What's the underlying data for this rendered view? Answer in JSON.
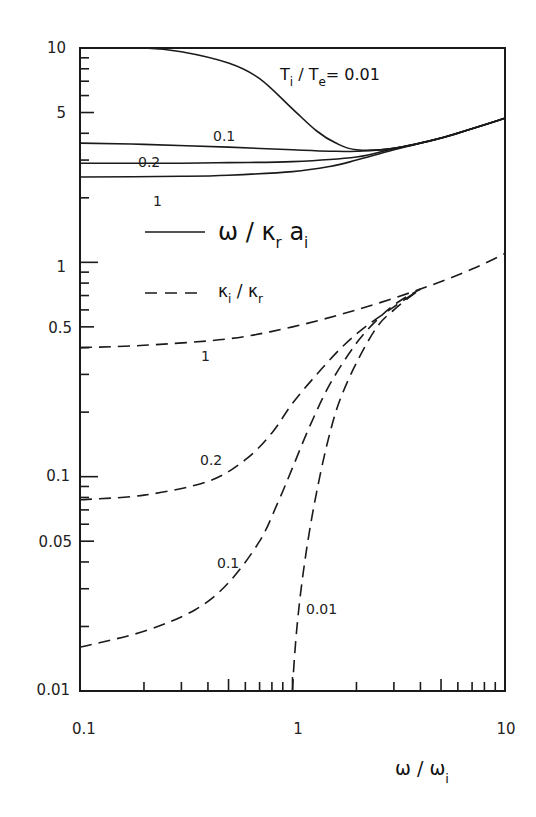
{
  "chart_data": {
    "type": "line",
    "title": "",
    "xlabel": "ω / ω_i",
    "ylabel": "",
    "xscale": "log",
    "yscale": "log",
    "xlim": [
      0.1,
      10
    ],
    "ylim": [
      0.01,
      10
    ],
    "grid": false,
    "legend_position": "upper-left inside plot",
    "x_tick_labels": [
      "0.1",
      "1",
      "10"
    ],
    "y_tick_labels": [
      "10",
      "5",
      "1",
      "0.5",
      "0.1",
      "0.05",
      "0.01"
    ],
    "annotation": "T_i / T_e = 0.01",
    "legend": [
      {
        "style": "solid",
        "label": "ω / κ_r a_i"
      },
      {
        "style": "dashed",
        "label": "κ_i / κ_r"
      }
    ],
    "series": [
      {
        "name": "ω/κ_r a_i, T_i/T_e = 0.01",
        "style": "solid",
        "label": "T_i / T_e = 0.01",
        "x": [
          0.1,
          0.2,
          0.3,
          0.5,
          0.7,
          1.0,
          1.3,
          1.6,
          2.0,
          3.0,
          5.0,
          7.0,
          10.0
        ],
        "y": [
          10.0,
          10.0,
          9.6,
          8.5,
          7.2,
          5.2,
          4.1,
          3.6,
          3.35,
          3.4,
          3.8,
          4.2,
          4.7
        ]
      },
      {
        "name": "ω/κ_r a_i, T_i/T_e = 0.1",
        "style": "solid",
        "label": "0.1",
        "x": [
          0.1,
          0.2,
          0.5,
          1.0,
          1.5,
          2.0,
          3.0,
          5.0,
          10.0
        ],
        "y": [
          3.6,
          3.55,
          3.45,
          3.35,
          3.3,
          3.3,
          3.4,
          3.8,
          4.7
        ]
      },
      {
        "name": "ω/κ_r a_i, T_i/T_e = 0.2",
        "style": "solid",
        "label": "0.2",
        "x": [
          0.1,
          0.3,
          0.5,
          1.0,
          2.0,
          3.0,
          5.0,
          10.0
        ],
        "y": [
          2.9,
          2.9,
          2.92,
          2.95,
          3.1,
          3.4,
          3.8,
          4.7
        ]
      },
      {
        "name": "ω/κ_r a_i, T_i/T_e = 1",
        "style": "solid",
        "label": "1",
        "x": [
          0.1,
          0.3,
          0.5,
          1.0,
          1.5,
          2.0,
          3.0,
          5.0,
          10.0
        ],
        "y": [
          2.5,
          2.52,
          2.55,
          2.65,
          2.8,
          3.0,
          3.35,
          3.8,
          4.7
        ]
      },
      {
        "name": "κ_i/κ_r, T_i/T_e = 1",
        "style": "dashed",
        "label": "1",
        "x": [
          0.1,
          0.2,
          0.5,
          1.0,
          2.0,
          4.0,
          7.0,
          10.0
        ],
        "y": [
          0.4,
          0.41,
          0.44,
          0.5,
          0.6,
          0.75,
          0.93,
          1.1
        ]
      },
      {
        "name": "κ_i/κ_r, T_i/T_e = 0.2",
        "style": "dashed",
        "label": "0.2",
        "x": [
          0.1,
          0.2,
          0.4,
          0.6,
          0.8,
          1.0,
          1.3,
          1.7,
          2.2,
          3.0,
          4.0
        ],
        "y": [
          0.078,
          0.082,
          0.095,
          0.12,
          0.16,
          0.22,
          0.3,
          0.4,
          0.5,
          0.62,
          0.75
        ]
      },
      {
        "name": "κ_i/κ_r, T_i/T_e = 0.1",
        "style": "dashed",
        "label": "0.1",
        "x": [
          0.1,
          0.2,
          0.35,
          0.5,
          0.7,
          0.85,
          1.0,
          1.2,
          1.5,
          2.0,
          2.6,
          3.2,
          4.0
        ],
        "y": [
          0.016,
          0.019,
          0.024,
          0.032,
          0.05,
          0.075,
          0.11,
          0.17,
          0.27,
          0.42,
          0.56,
          0.66,
          0.75
        ]
      },
      {
        "name": "κ_i/κ_r, T_i/T_e = 0.01",
        "style": "dashed",
        "label": "0.01",
        "x": [
          1.0,
          1.02,
          1.06,
          1.12,
          1.2,
          1.3,
          1.45,
          1.65,
          2.0,
          2.5,
          3.0,
          3.5,
          4.0
        ],
        "y": [
          0.01,
          0.014,
          0.022,
          0.035,
          0.055,
          0.085,
          0.14,
          0.22,
          0.34,
          0.5,
          0.6,
          0.68,
          0.75
        ]
      }
    ]
  },
  "labels": {
    "y_ticks": [
      {
        "text": "10",
        "value": 10
      },
      {
        "text": "5",
        "value": 5
      },
      {
        "text": "1",
        "value": 1
      },
      {
        "text": "0.5",
        "value": 0.5
      },
      {
        "text": "0.1",
        "value": 0.1
      },
      {
        "text": "0.05",
        "value": 0.05
      },
      {
        "text": "0.01",
        "value": 0.01
      }
    ],
    "x_ticks": [
      {
        "text": "0.1",
        "value": 0.1
      },
      {
        "text": "1",
        "value": 1
      },
      {
        "text": "10",
        "value": 10
      }
    ],
    "x_axis_title": "ω / ω",
    "x_axis_title_sub": "i",
    "annotation_main": "T",
    "annotation_sub1": "i",
    "annotation_mid": " / T",
    "annotation_sub2": "e",
    "annotation_tail": "= 0.01",
    "legend_solid_main": "ω / κ",
    "legend_solid_sub1": "r",
    "legend_solid_mid": " a",
    "legend_solid_sub2": "i",
    "legend_dashed_main": "κ",
    "legend_dashed_sub1": "i",
    "legend_dashed_mid": " / κ",
    "legend_dashed_sub2": "r",
    "curve_labels": {
      "solid_0_1": "0.1",
      "solid_0_2": "0.2",
      "solid_1": "1",
      "dashed_1": "1",
      "dashed_0_2": "0.2",
      "dashed_0_1": "0.1",
      "dashed_0_01": "0.01"
    }
  },
  "colors": {
    "ink": "#1a1a1a",
    "background": "#ffffff"
  }
}
